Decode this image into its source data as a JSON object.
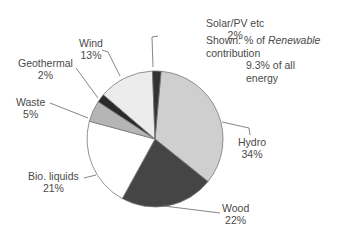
{
  "chart_data": {
    "type": "pie",
    "title": "",
    "annotation": {
      "line1_prefix": "Shown: % of ",
      "line1_italic": "Renewable",
      "line2": "contribution",
      "line3": "9.3% of all",
      "line4": "energy"
    },
    "slices": [
      {
        "label": "Hydro",
        "value": 34,
        "display": "34%",
        "color": "#cfcfcf"
      },
      {
        "label": "Wood",
        "value": 22,
        "display": "22%",
        "color": "#454545"
      },
      {
        "label": "Bio. liquids",
        "value": 21,
        "display": "21%",
        "color": "#ffffff"
      },
      {
        "label": "Waste",
        "value": 5,
        "display": "5%",
        "color": "#b5b5b5"
      },
      {
        "label": "Geothermal",
        "value": 2,
        "display": "2%",
        "color": "#2a2a2a"
      },
      {
        "label": "Wind",
        "value": 13,
        "display": "13%",
        "color": "#ececec"
      },
      {
        "label": "Solar/PV etc",
        "value": 2,
        "display": "2%",
        "color": "#333333"
      }
    ],
    "categories": [
      "Hydro",
      "Wood",
      "Bio. liquids",
      "Waste",
      "Geothermal",
      "Wind",
      "Solar/PV etc"
    ],
    "values": [
      34,
      22,
      21,
      5,
      2,
      13,
      2
    ]
  }
}
